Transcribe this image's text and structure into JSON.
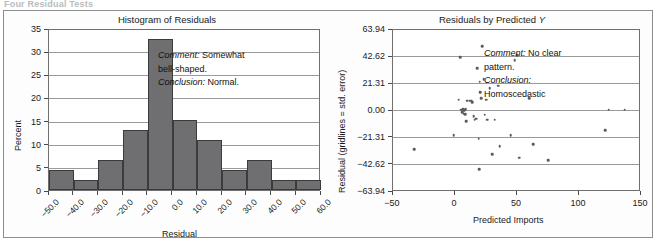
{
  "top_heading": "Four Residual Tests",
  "figure": {
    "panels": [
      {
        "id": "histogram",
        "title": "Histogram of Residuals",
        "annotation": {
          "comment_label": "Comment:",
          "comment_text": "Somewhat bell-shaped.",
          "conclusion_label": "Conclusion:",
          "conclusion_text": "Normal."
        }
      },
      {
        "id": "scatter",
        "title_prefix": "Residuals by Predicted ",
        "title_italic": "Y",
        "annotation": {
          "comment_label": "Comment:",
          "comment_text": "No clear pattern.",
          "conclusion_label": "Conclusion:",
          "conclusion_text": "Homoscedastic"
        }
      }
    ]
  },
  "chart_data": [
    {
      "type": "bar",
      "id": "histogram-of-residuals",
      "title": "Histogram of Residuals",
      "xlabel": "Residual",
      "ylabel": "Percent",
      "ylim": [
        0,
        35
      ],
      "yticks": [
        0,
        5,
        10,
        15,
        20,
        25,
        30,
        35
      ],
      "xlim": [
        -50,
        60
      ],
      "xticks": [
        "-50.0",
        "-40.0",
        "-30.0",
        "-20.0",
        "-10.0",
        "0.0",
        "10.0",
        "20.0",
        "30.0",
        "40.0",
        "50.0",
        "60.0"
      ],
      "bin_edges": [
        -50,
        -40,
        -30,
        -20,
        -10,
        0,
        10,
        20,
        30,
        40,
        50,
        60
      ],
      "categories": [
        "-50 to -40",
        "-40 to -30",
        "-30 to -20",
        "-20 to -10",
        "-10 to 0",
        "0 to 10",
        "10 to 20",
        "20 to 30",
        "30 to 40",
        "40 to 50",
        "50 to 60"
      ],
      "values": [
        4.3,
        2.2,
        6.5,
        12.9,
        32.6,
        15.1,
        10.8,
        4.3,
        6.5,
        2.2,
        2.2
      ],
      "grid": true,
      "bar_color": "#6f6e70",
      "annotation": "Comment: Somewhat bell-shaped. Conclusion: Normal."
    },
    {
      "type": "scatter",
      "id": "residuals-by-predicted-y",
      "title": "Residuals by Predicted Y",
      "xlabel": "Predicted Imports",
      "ylabel": "Residual (gridlines = std. error)",
      "xlim": [
        -50,
        150
      ],
      "xticks": [
        -50,
        0,
        50,
        100,
        150
      ],
      "ylim": [
        -63.94,
        63.94
      ],
      "yticks": [
        "63.94",
        "42.62",
        "21.31",
        "0.00",
        "-21.31",
        "-42.62",
        "-63.94"
      ],
      "ytick_values": [
        63.94,
        42.62,
        21.31,
        0.0,
        -21.31,
        -42.62,
        -63.94
      ],
      "grid": true,
      "point_color": "#5b5b5b",
      "points": [
        {
          "x": -33,
          "y": -30
        },
        {
          "x": -1,
          "y": -19
        },
        {
          "x": 3,
          "y": 9
        },
        {
          "x": 4,
          "y": 42.6
        },
        {
          "x": 5,
          "y": 1
        },
        {
          "x": 6,
          "y": -1
        },
        {
          "x": 6.5,
          "y": 1.5
        },
        {
          "x": 7,
          "y": -2
        },
        {
          "x": 7.5,
          "y": 0.5
        },
        {
          "x": 8,
          "y": -2.5
        },
        {
          "x": 8.5,
          "y": 1.5
        },
        {
          "x": 9,
          "y": -8
        },
        {
          "x": 10,
          "y": 8
        },
        {
          "x": 12,
          "y": 8
        },
        {
          "x": 13,
          "y": 8
        },
        {
          "x": 14,
          "y": 7
        },
        {
          "x": 15,
          "y": -4
        },
        {
          "x": 16,
          "y": -7
        },
        {
          "x": 17,
          "y": -6
        },
        {
          "x": 18,
          "y": 34
        },
        {
          "x": 19,
          "y": -22
        },
        {
          "x": 19.5,
          "y": -46
        },
        {
          "x": 20,
          "y": 23
        },
        {
          "x": 20.5,
          "y": 15
        },
        {
          "x": 21,
          "y": 10
        },
        {
          "x": 22,
          "y": 51
        },
        {
          "x": 23,
          "y": 25
        },
        {
          "x": 24,
          "y": -3
        },
        {
          "x": 25,
          "y": 9
        },
        {
          "x": 26,
          "y": -7
        },
        {
          "x": 28,
          "y": 18
        },
        {
          "x": 30,
          "y": -34
        },
        {
          "x": 32,
          "y": -7
        },
        {
          "x": 35,
          "y": 20
        },
        {
          "x": 36,
          "y": -28
        },
        {
          "x": 45,
          "y": -19
        },
        {
          "x": 48,
          "y": 40
        },
        {
          "x": 50,
          "y": 44
        },
        {
          "x": 52,
          "y": -37
        },
        {
          "x": 60,
          "y": 10
        },
        {
          "x": 63,
          "y": -26
        },
        {
          "x": 75,
          "y": -39
        },
        {
          "x": 121,
          "y": -15
        },
        {
          "x": 124,
          "y": 1
        },
        {
          "x": 137,
          "y": 1
        }
      ],
      "annotation": "Comment: No clear pattern. Conclusion: Homoscedastic"
    }
  ]
}
